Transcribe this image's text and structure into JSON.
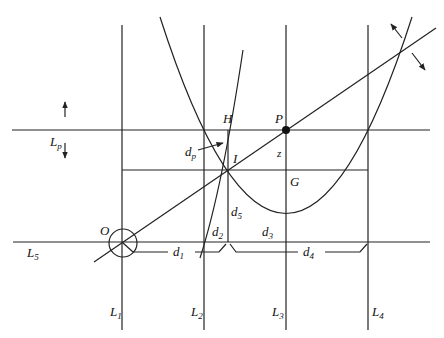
{
  "diagram": {
    "type": "geometric-construction",
    "colors": {
      "stroke": "#222222",
      "background": "#ffffff",
      "text": "#111111"
    },
    "vertical_lines": [
      {
        "id": "L1",
        "label": "L",
        "sub": "1",
        "x": 122
      },
      {
        "id": "L2",
        "label": "L",
        "sub": "2",
        "x": 204
      },
      {
        "id": "L3",
        "label": "L",
        "sub": "3",
        "x": 286
      },
      {
        "id": "L4",
        "label": "L",
        "sub": "4",
        "x": 368
      }
    ],
    "horizontal_lines": [
      {
        "id": "Lp",
        "label": "L",
        "sub": "p",
        "y": 130
      },
      {
        "id": "L5",
        "label": "L",
        "sub": "5",
        "y": 242
      }
    ],
    "points": {
      "O": "O",
      "P": "P",
      "H": "H",
      "I": "I",
      "G": "G"
    },
    "distances": {
      "dp": {
        "label": "d",
        "sub": "p"
      },
      "d1": {
        "label": "d",
        "sub": "1"
      },
      "d2": {
        "label": "d",
        "sub": "2"
      },
      "d3": {
        "label": "d",
        "sub": "3"
      },
      "d4": {
        "label": "d",
        "sub": "4"
      },
      "d5": {
        "label": "d",
        "sub": "5"
      },
      "z": "z"
    }
  }
}
